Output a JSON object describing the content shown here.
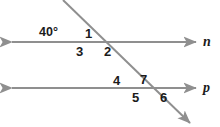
{
  "figure": {
    "type": "geometry-diagram",
    "width": 220,
    "height": 127,
    "background_color": "#ffffff",
    "line_color": "#8f8f8f",
    "text_color": "#1b1b1b"
  },
  "lines": [
    {
      "id": "line-n",
      "name": "n",
      "kind": "horizontal-parallel",
      "arrows": "both",
      "x1": 12,
      "y1": 42,
      "x2": 196,
      "y2": 42
    },
    {
      "id": "line-p",
      "name": "p",
      "kind": "horizontal-parallel",
      "arrows": "both",
      "x1": 12,
      "y1": 88,
      "x2": 196,
      "y2": 88
    },
    {
      "id": "transversal",
      "name": "",
      "kind": "transversal",
      "arrows": "both",
      "x1": 63,
      "y1": 0,
      "x2": 190,
      "y2": 123
    }
  ],
  "line_labels": [
    {
      "text": "n",
      "x": 203,
      "y": 35
    },
    {
      "text": "p",
      "x": 203,
      "y": 81
    }
  ],
  "intersections": [
    {
      "id": "upper",
      "line": "n",
      "x": 88,
      "y": 42
    },
    {
      "id": "lower",
      "line": "p",
      "x": 145,
      "y": 88
    }
  ],
  "angle_labels": [
    {
      "id": "angle-40",
      "text": "40°",
      "x": 39,
      "y": 26,
      "kind": "measure",
      "at": "upper"
    },
    {
      "id": "angle-1",
      "text": "1",
      "x": 85,
      "y": 27,
      "kind": "number",
      "at": "upper"
    },
    {
      "id": "angle-3",
      "text": "3",
      "x": 76,
      "y": 45,
      "kind": "number",
      "at": "upper"
    },
    {
      "id": "angle-2",
      "text": "2",
      "x": 104,
      "y": 45,
      "kind": "number",
      "at": "upper"
    },
    {
      "id": "angle-4",
      "text": "4",
      "x": 113,
      "y": 74,
      "kind": "number",
      "at": "lower"
    },
    {
      "id": "angle-7",
      "text": "7",
      "x": 140,
      "y": 73,
      "kind": "number",
      "at": "lower"
    },
    {
      "id": "angle-5",
      "text": "5",
      "x": 132,
      "y": 91,
      "kind": "number",
      "at": "lower"
    },
    {
      "id": "angle-6",
      "text": "6",
      "x": 160,
      "y": 91,
      "kind": "number",
      "at": "lower"
    }
  ]
}
